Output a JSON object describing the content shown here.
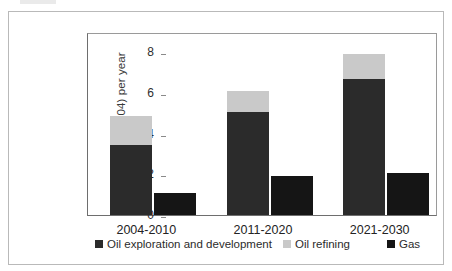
{
  "chart_data": {
    "type": "bar",
    "title": "",
    "subtitle": "",
    "xlabel": "",
    "ylabel": "billion dollars (2004) per year",
    "categories": [
      "2004-2010",
      "2011-2020",
      "2021-2030"
    ],
    "ylim": [
      0,
      9
    ],
    "yticks": [
      0,
      2,
      4,
      6,
      8
    ],
    "ytick_labels": [
      "0",
      "2",
      "4",
      "6",
      "8"
    ],
    "grid": false,
    "legend_position": "bottom",
    "stacked": true,
    "series": [
      {
        "name": "Oil exploration and development",
        "color": "#2b2b2b",
        "stack": "oil",
        "values": [
          3.45,
          5.05,
          6.7
        ]
      },
      {
        "name": "Oil refining",
        "color": "#c9c9c9",
        "stack": "oil",
        "values": [
          1.4,
          1.05,
          1.2
        ]
      },
      {
        "name": "Gas",
        "color": "#151515",
        "stack": "gas",
        "values": [
          1.1,
          1.9,
          2.05
        ]
      }
    ],
    "stack_totals": {
      "oil": [
        4.85,
        6.1,
        7.9
      ]
    }
  },
  "axis": {
    "y_label": "billion dollars (2004) per year",
    "y_ticks": [
      "0",
      "2",
      "4",
      "6",
      "8"
    ],
    "x_ticks": [
      "2004-2010",
      "2011-2020",
      "2021-2030"
    ]
  },
  "legend": {
    "items": [
      {
        "label": "Oil exploration and development",
        "color": "#2b2b2b"
      },
      {
        "label": "Oil refining",
        "color": "#c9c9c9"
      },
      {
        "label": "Gas",
        "color": "#151515"
      }
    ]
  },
  "colors": {
    "oil_exploration": "#2b2b2b",
    "oil_refining": "#c9c9c9",
    "gas": "#151515",
    "axis": "#6e6e6e",
    "frame": "#b9b9b9",
    "background": "#ffffff"
  }
}
